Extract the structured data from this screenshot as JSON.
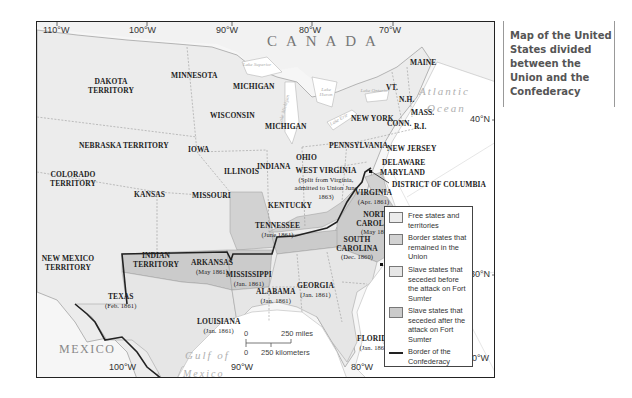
{
  "caption": {
    "text": "Map of the United States divided between the Union and the Confederacy"
  },
  "colors": {
    "free": "#ececec",
    "border_states": "#d2d2d2",
    "seceded_before": "#e6e6e6",
    "seceded_after": "#cbcbcb",
    "confederacy_border": "#222222",
    "water": "#ffffff",
    "foreign_land": "#f6f6f6"
  },
  "coordinates": {
    "top": [
      "110°W",
      "100°W",
      "90°W",
      "80°W",
      "70°W"
    ],
    "bottom": [
      "100°W",
      "90°W",
      "80°W",
      "70°W"
    ],
    "right": [
      "40°N",
      "30°N"
    ]
  },
  "countries": {
    "canada": "C A N A D A",
    "mexico": "MEXICO"
  },
  "water_bodies": {
    "atlantic_1": "Atlantic",
    "atlantic_2": "Ocean",
    "gulf_1": "Gulf of",
    "gulf_2": "Mexico",
    "lake_superior": "Lake Superior",
    "lake_michigan": "Lake Michigan",
    "lake_huron": "Lake Huron",
    "lake_ontario": "Lake Ontario",
    "lake_erie": "Lake Erie"
  },
  "states": {
    "dakota": "DAKOTA TERRITORY",
    "minnesota": "MINNESOTA",
    "michigan_up": "MICHIGAN",
    "michigan": "MICHIGAN",
    "wisconsin": "WISCONSIN",
    "nebraska": "NEBRASKA TERRITORY",
    "iowa": "IOWA",
    "illinois": "ILLINOIS",
    "indiana": "INDIANA",
    "ohio": "OHIO",
    "colorado": "COLORADO TERRITORY",
    "kansas": "KANSAS",
    "missouri": "MISSOURI",
    "kentucky": "KENTUCKY",
    "west_virginia": "WEST VIRGINIA",
    "west_virginia_note": "(Split from Virginia, admitted to Union June 1863)",
    "new_mexico": "NEW MEXICO TERRITORY",
    "indian_territory": "INDIAN TERRITORY",
    "arkansas": "ARKANSAS",
    "arkansas_date": "(May 1861)",
    "tennessee": "TENNESSEE",
    "tennessee_date": "(June 1861)",
    "virginia": "VIRGINIA",
    "virginia_date": "(Apr. 1861)",
    "north_carolina": "NORTH CAROLINA",
    "north_carolina_date": "(May 1861)",
    "south_carolina": "SOUTH CAROLINA",
    "south_carolina_date": "(Dec. 1860)",
    "texas": "TEXAS",
    "texas_date": "(Feb. 1861)",
    "louisiana": "LOUISIANA",
    "louisiana_date": "(Jan. 1861)",
    "mississippi": "MISSISSIPPI",
    "mississippi_date": "(Jan. 1861)",
    "alabama": "ALABAMA",
    "alabama_date": "(Jan. 1861)",
    "georgia": "GEORGIA",
    "georgia_date": "(Jan. 1861)",
    "florida": "FLORIDA",
    "florida_date": "(Jan. 1861)",
    "maine": "MAINE",
    "vermont": "VT.",
    "new_hampshire": "N.H.",
    "massachusetts": "MASS.",
    "new_york": "NEW YORK",
    "connecticut": "CONN.",
    "rhode_island": "R.I.",
    "pennsylvania": "PENNSYLVANIA",
    "new_jersey": "NEW JERSEY",
    "delaware": "DELAWARE",
    "maryland": "MARYLAND",
    "dc": "DISTRICT OF COLUMBIA",
    "fort_sumter": "Fort Sumter"
  },
  "scale": {
    "zero_miles": "0",
    "miles": "250 miles",
    "zero_km": "0",
    "km": "250 kilometers"
  },
  "legend": {
    "items": [
      {
        "label": "Free states and territories",
        "swatch": "#ececec"
      },
      {
        "label": "Border states that remained in the Union",
        "swatch": "#d2d2d2"
      },
      {
        "label": "Slave states that seceded before the attack on Fort Sumter",
        "swatch": "#e6e6e6"
      },
      {
        "label": "Slave states that seceded after the attack on Fort Sumter",
        "swatch": "#cbcbcb"
      },
      {
        "label": "Border of the Confederacy",
        "swatch": "line"
      }
    ]
  }
}
